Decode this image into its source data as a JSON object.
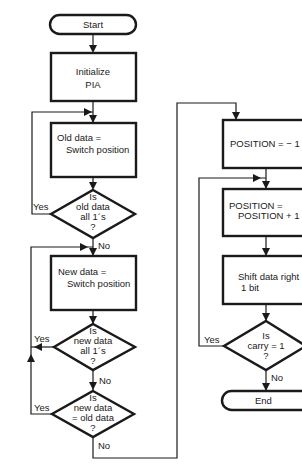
{
  "flowchart": {
    "left_column": {
      "start": "Start",
      "init": [
        "Initialize",
        "PIA"
      ],
      "old_data": [
        "Old data =",
        "Switch position"
      ],
      "dec_old": [
        "Is",
        "old data",
        "all 1´s",
        "?"
      ],
      "new_data": [
        "New data =",
        "Switch position"
      ],
      "dec_new_ones": [
        "Is",
        "new data",
        "all 1´s",
        "?"
      ],
      "dec_new_eq_old": [
        "Is",
        "new data",
        "= old data",
        "?"
      ]
    },
    "right_column": {
      "pos_init": "POSITION = − 1",
      "pos_inc": [
        "POSITION =",
        "POSITION + 1"
      ],
      "shift": [
        "Shift data right",
        "1 bit"
      ],
      "dec_carry": [
        "Is",
        "carry = 1",
        "?"
      ],
      "end": "End"
    },
    "branch_labels": {
      "yes": "Yes",
      "no": "No"
    }
  }
}
